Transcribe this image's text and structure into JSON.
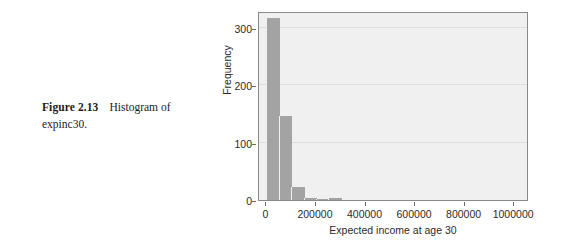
{
  "caption": {
    "label": "Figure 2.13",
    "text": "Histogram of expinc30."
  },
  "chart_data": {
    "type": "bar",
    "title": "",
    "subtitle": "",
    "xlabel": "Expected income at age 30",
    "ylabel": "Frequency",
    "xlim": [
      -30000,
      1060000
    ],
    "ylim": [
      0,
      330
    ],
    "xticks": [
      0,
      200000,
      400000,
      600000,
      800000,
      1000000
    ],
    "xticklabels": [
      "0",
      "200000",
      "400000",
      "600000",
      "800000",
      "1000000"
    ],
    "yticks": [
      0,
      100,
      200,
      300
    ],
    "yticklabels": [
      "0",
      "100",
      "200",
      "300"
    ],
    "grid": "horizontal",
    "legend": "none",
    "bin_width": 50000,
    "bin_starts": [
      0,
      50000,
      100000,
      150000,
      200000,
      250000
    ],
    "categories": [
      "0-50000",
      "50000-100000",
      "100000-150000",
      "150000-200000",
      "200000-250000",
      "250000-300000"
    ],
    "values": [
      318,
      147,
      22,
      4,
      1,
      4
    ],
    "bar_color": "#a3a3a3",
    "panel_color": "#f0f0f0",
    "grid_color": "#dcdcdc",
    "axis_color": "#8a8a8a"
  }
}
